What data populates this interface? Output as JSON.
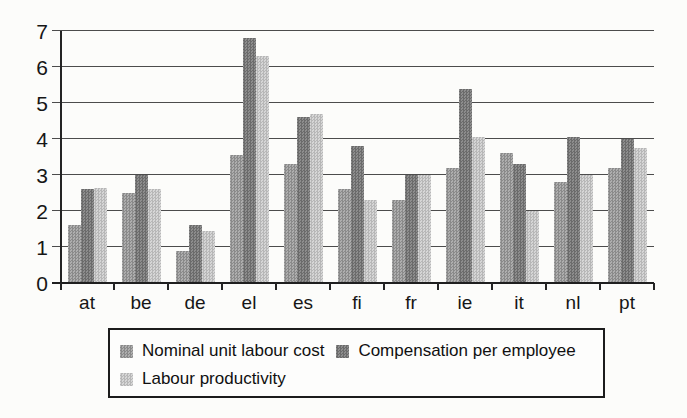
{
  "chart_data": {
    "type": "bar",
    "title": "",
    "xlabel": "",
    "ylabel": "",
    "categories": [
      "at",
      "be",
      "de",
      "el",
      "es",
      "fi",
      "fr",
      "ie",
      "it",
      "nl",
      "pt"
    ],
    "series": [
      {
        "name": "Nominal unit labour cost",
        "values": [
          1.6,
          2.5,
          0.9,
          3.55,
          3.3,
          2.6,
          2.3,
          3.2,
          3.6,
          2.8,
          3.2
        ],
        "color": "#9b9b9b",
        "pattern_dark": "#8a8a8a",
        "pattern_light": "#aeaeae"
      },
      {
        "name": "Compensation per employee",
        "values": [
          2.6,
          3.0,
          1.6,
          6.8,
          4.6,
          3.8,
          3.0,
          5.4,
          3.3,
          4.05,
          4.0
        ],
        "color": "#7c7c7c",
        "pattern_dark": "#6b6b6b",
        "pattern_light": "#8d8d8d"
      },
      {
        "name": "Labour productivity",
        "values": [
          2.65,
          2.6,
          1.45,
          6.3,
          4.7,
          2.3,
          3.0,
          4.05,
          2.0,
          3.0,
          3.75
        ],
        "color": "#c6c6c6",
        "pattern_dark": "#b7b7b7",
        "pattern_light": "#d6d6d6"
      }
    ],
    "ylim": [
      0,
      7
    ],
    "yticks": [
      0,
      1,
      2,
      3,
      4,
      5,
      6,
      7
    ],
    "grid": "horizontal",
    "legend_position": "bottom"
  },
  "colors": {
    "background": "#fcfcfa",
    "axis": "#242424",
    "gridline": "#4c4c4c",
    "text": "#161616"
  }
}
